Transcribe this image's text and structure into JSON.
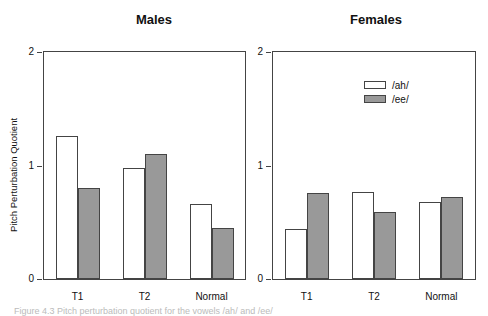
{
  "chart_data": [
    {
      "type": "bar",
      "title": "Males",
      "ylabel": "Pitch Perturbation Quotient",
      "xlabel": "",
      "categories": [
        "T1",
        "T2",
        "Normal"
      ],
      "series": [
        {
          "name": "/ah/",
          "color": "#ffffff",
          "values": [
            1.26,
            0.98,
            0.66
          ]
        },
        {
          "name": "/ee/",
          "color": "#999999",
          "values": [
            0.8,
            1.1,
            0.45
          ]
        }
      ],
      "ylim": [
        0,
        2
      ],
      "yticks": [
        "0",
        "1",
        "2"
      ],
      "grid": false
    },
    {
      "type": "bar",
      "title": "Females",
      "ylabel": "",
      "xlabel": "",
      "categories": [
        "T1",
        "T2",
        "Normal"
      ],
      "series": [
        {
          "name": "/ah/",
          "color": "#ffffff",
          "values": [
            0.44,
            0.77,
            0.68
          ]
        },
        {
          "name": "/ee/",
          "color": "#999999",
          "values": [
            0.76,
            0.59,
            0.72
          ]
        }
      ],
      "ylim": [
        0,
        2
      ],
      "yticks": [
        "0",
        "1",
        "2"
      ],
      "grid": false,
      "legend": {
        "position": "upper center",
        "entries": [
          "/ah/",
          "/ee/"
        ]
      }
    }
  ],
  "panels": {
    "males": {
      "title": "Males",
      "ylabel": "Pitch Perturbation Quotient"
    },
    "females": {
      "title": "Females"
    }
  },
  "legend": {
    "ah": "/ah/",
    "ee": "/ee/"
  },
  "caption": "Figure 4.3  Pitch perturbation quotient for the vowels /ah/ and /ee/"
}
